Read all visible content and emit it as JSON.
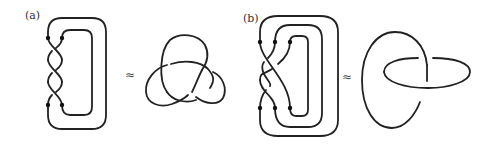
{
  "figure": {
    "panels": [
      {
        "id": "a",
        "label": "(a)",
        "relation_symbol": "≈",
        "left_diagram": "closed 2-strand braid with 3 crossings (braid closure)",
        "right_diagram": "trefoil knot",
        "braid_strands": 2,
        "crossings": 3
      },
      {
        "id": "b",
        "label": "(b)",
        "relation_symbol": "≈",
        "left_diagram": "closed 3-strand braid with 2 crossings (braid closure)",
        "right_diagram": "Hopf link",
        "braid_strands": 3,
        "crossings": 2
      }
    ],
    "colors": {
      "stroke": "#222222",
      "background": "#ffffff"
    }
  }
}
